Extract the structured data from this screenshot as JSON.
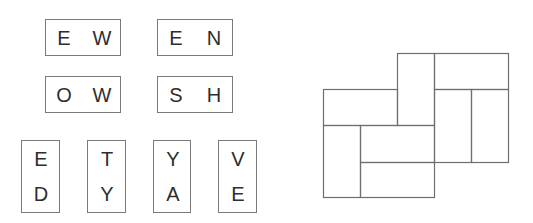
{
  "horizontal_tiles": [
    {
      "top": "E",
      "bottom": "W",
      "letters": [
        "E",
        "W"
      ],
      "x": 45,
      "y": 19,
      "w": 76,
      "h": 37
    },
    {
      "letters": [
        "E",
        "N"
      ],
      "x": 157,
      "y": 19,
      "w": 76,
      "h": 37
    },
    {
      "letters": [
        "O",
        "W"
      ],
      "x": 45,
      "y": 76,
      "w": 76,
      "h": 37
    },
    {
      "letters": [
        "S",
        "H"
      ],
      "x": 157,
      "y": 76,
      "w": 76,
      "h": 37
    }
  ],
  "vertical_tiles": [
    {
      "letters": [
        "E",
        "D"
      ],
      "x": 21,
      "y": 140,
      "w": 39,
      "h": 73
    },
    {
      "letters": [
        "T",
        "Y"
      ],
      "x": 87,
      "y": 140,
      "w": 39,
      "h": 73
    },
    {
      "letters": [
        "Y",
        "A"
      ],
      "x": 153,
      "y": 140,
      "w": 38,
      "h": 73
    },
    {
      "letters": [
        "V",
        "E"
      ],
      "x": 218,
      "y": 140,
      "w": 39,
      "h": 73
    }
  ],
  "puzzle_grid": {
    "stroke": "#6e6e6e",
    "pieces": [
      {
        "orientation": "vertical",
        "x": 397,
        "y": 53,
        "w": 37,
        "h": 72
      },
      {
        "orientation": "horizontal",
        "x": 434,
        "y": 53,
        "w": 74,
        "h": 36
      },
      {
        "orientation": "horizontal",
        "x": 323,
        "y": 89,
        "w": 74,
        "h": 36
      },
      {
        "orientation": "vertical",
        "x": 434,
        "y": 89,
        "w": 37,
        "h": 73
      },
      {
        "orientation": "vertical",
        "x": 471,
        "y": 89,
        "w": 37,
        "h": 73
      },
      {
        "orientation": "vertical",
        "x": 323,
        "y": 125,
        "w": 37,
        "h": 72
      },
      {
        "orientation": "horizontal",
        "x": 360,
        "y": 125,
        "w": 74,
        "h": 37
      },
      {
        "orientation": "horizontal",
        "x": 360,
        "y": 162,
        "w": 74,
        "h": 35
      }
    ]
  }
}
